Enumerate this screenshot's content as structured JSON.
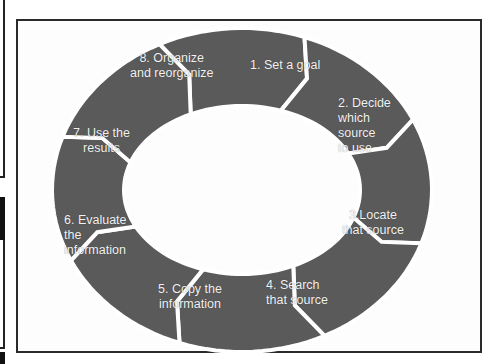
{
  "diagram": {
    "type": "cycle",
    "shape": "ring of chevron arrows, clockwise",
    "segment_color": "#5a5a5a",
    "separator_color": "#ffffff",
    "text_color": "#f2f2f2",
    "steps": [
      {
        "label": "1. Set a goal"
      },
      {
        "label": "2. Decide\nwhich\nsource\nto use"
      },
      {
        "label": "3.Locate\nthat source"
      },
      {
        "label": "4. Search\nthat source"
      },
      {
        "label": "5. Copy the\ninformation"
      },
      {
        "label": "6. Evaluate\nthe\ninformation"
      },
      {
        "label": "7. Use the\nresults"
      },
      {
        "label": "8. Organize\nand reorganize"
      }
    ]
  }
}
